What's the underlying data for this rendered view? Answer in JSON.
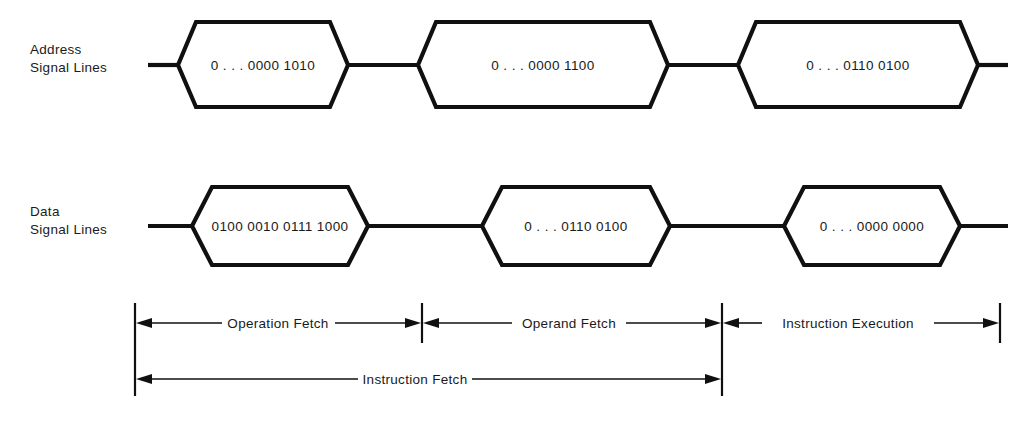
{
  "diagram": {
    "colors": {
      "background": "#ffffff",
      "ink": "#101010",
      "text": "#1a1a1a"
    },
    "rows": [
      {
        "id": "address",
        "label_line1": "Address",
        "label_line2": "Signal Lines",
        "values": [
          "0 . . . 0000 1010",
          "0 . . . 0000 1100",
          "0 . . . 0110 0100"
        ]
      },
      {
        "id": "data",
        "label_line1": "Data",
        "label_line2": "Signal Lines",
        "values": [
          "0100 0010 0111 1000",
          "0 . . . 0110 0100",
          "0 . . . 0000 0000"
        ]
      }
    ],
    "phases": {
      "upper": [
        {
          "label": "Operation Fetch"
        },
        {
          "label": "Operand Fetch"
        },
        {
          "label": "Instruction Execution"
        }
      ],
      "lower": [
        {
          "label": "Instruction Fetch"
        }
      ]
    }
  }
}
